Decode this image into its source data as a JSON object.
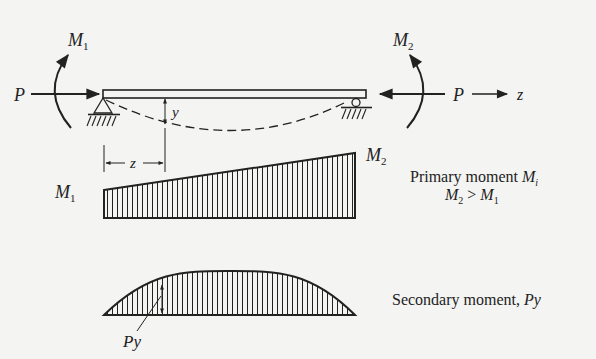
{
  "figure": {
    "colors": {
      "background": "#f4f4f2",
      "ink": "#222222"
    }
  },
  "labels": {
    "P_left": "P",
    "P_right": "P",
    "M1_top": "M",
    "M1_top_sub": "1",
    "M2_top": "M",
    "M2_top_sub": "2",
    "z_axis": "z",
    "y_dim": "y",
    "z_dim": "z",
    "M1_diag": "M",
    "M1_diag_sub": "1",
    "M2_diag": "M",
    "M2_diag_sub": "2",
    "Py": "Py"
  },
  "captions": {
    "primary_line1_text": "Primary moment ",
    "primary_line1_sym": "M",
    "primary_line1_sub": "i",
    "primary_line2_a": "M",
    "primary_line2_a_sub": "2",
    "primary_line2_op": " > ",
    "primary_line2_b": "M",
    "primary_line2_b_sub": "1",
    "secondary_text": "Secondary moment, ",
    "secondary_sym": "Py"
  }
}
